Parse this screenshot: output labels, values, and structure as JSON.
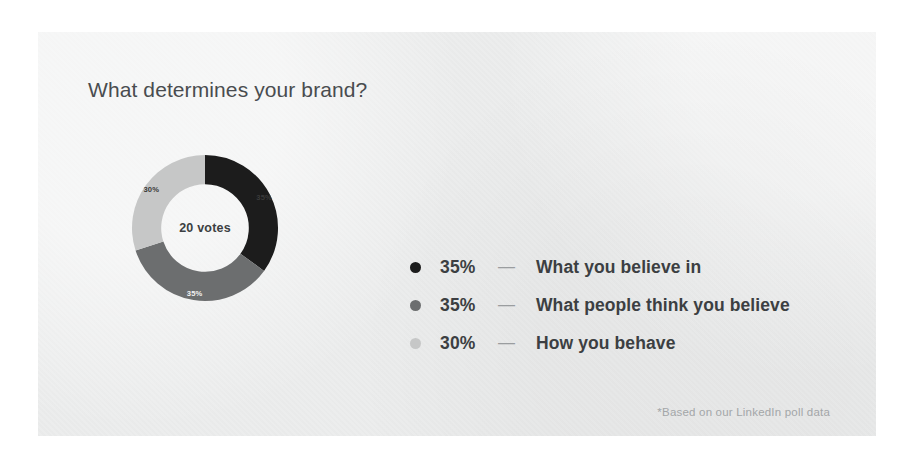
{
  "card": {
    "background_color": "#eceded",
    "page_background_color": "#ffffff"
  },
  "title": "What determines your brand?",
  "center_label": "20 votes",
  "footnote": "*Based on our LinkedIn poll data",
  "legend": {
    "dash": "—",
    "items": [
      {
        "percent": "35%",
        "label": "What you believe in",
        "color": "#1c1c1c"
      },
      {
        "percent": "35%",
        "label": "What people think you believe",
        "color": "#6c6e6f"
      },
      {
        "percent": "30%",
        "label": "How you behave",
        "color": "#c6c7c7"
      }
    ]
  },
  "chart_data": {
    "type": "pie",
    "variant": "donut",
    "title": "What determines your brand?",
    "center_text": "20 votes",
    "total_votes": 20,
    "unit": "%",
    "start_angle_deg": 0,
    "direction": "clockwise",
    "hole_ratio": 0.6,
    "grid": false,
    "legend_position": "right",
    "annotations": [
      "*Based on our LinkedIn poll data"
    ],
    "labels": [
      "What you believe in",
      "What people think you believe",
      "How you behave"
    ],
    "values": [
      35,
      35,
      30
    ],
    "value_labels": [
      "35%",
      "35%",
      "30%"
    ],
    "colors": [
      "#1c1c1c",
      "#6c6e6f",
      "#c6c7c7"
    ],
    "slices": [
      {
        "label": "What you believe in",
        "value": 35,
        "value_label": "35%",
        "color": "#1c1c1c",
        "label_color": "#3a3a3a"
      },
      {
        "label": "What people think you believe",
        "value": 35,
        "value_label": "35%",
        "color": "#6c6e6f",
        "label_color": "#f2f2f2"
      },
      {
        "label": "How you behave",
        "value": 30,
        "value_label": "30%",
        "color": "#c6c7c7",
        "label_color": "#3a3a3a"
      }
    ]
  }
}
